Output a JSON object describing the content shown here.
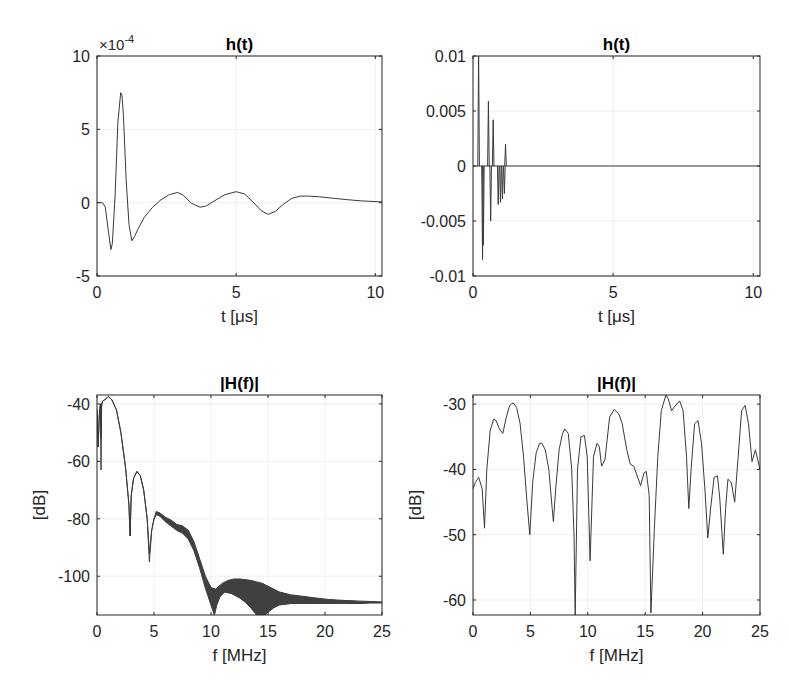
{
  "figure": {
    "width": 789,
    "height": 696,
    "line_color": "#3a3a3a",
    "axis_color": "#262626"
  },
  "chart_data": [
    {
      "id": "top-left",
      "type": "line",
      "title": "h(t)",
      "xlabel": "t [μs]",
      "ylabel": "",
      "exponent_label": "×10",
      "exponent_power": "-4",
      "box": {
        "left": 97,
        "top": 56,
        "right": 382,
        "bottom": 276
      },
      "xlim": [
        0,
        10.24
      ],
      "ylim": [
        -5,
        10
      ],
      "xticks": [
        0,
        5,
        10
      ],
      "xtick_labels": [
        "0",
        "5",
        "10"
      ],
      "yticks": [
        -5,
        0,
        5,
        10
      ],
      "ytick_labels": [
        "-5",
        "0",
        "5",
        "10"
      ],
      "grid": true,
      "y_scale_note": "values in units of 1e-4",
      "series": [
        {
          "name": "h(t)",
          "x": [
            0,
            0.2,
            0.3,
            0.4,
            0.5,
            0.55,
            0.65,
            0.75,
            0.85,
            0.9,
            0.95,
            1.05,
            1.15,
            1.25,
            1.35,
            1.5,
            1.7,
            2.0,
            2.3,
            2.6,
            2.9,
            3.1,
            3.4,
            3.7,
            3.9,
            4.2,
            4.6,
            5.0,
            5.3,
            5.6,
            5.9,
            6.15,
            6.4,
            6.7,
            7.0,
            7.3,
            7.6,
            8.0,
            8.5,
            9.0,
            9.5,
            10.24
          ],
          "y": [
            0,
            0,
            -0.3,
            -1.8,
            -3.2,
            -2.8,
            0.5,
            5.5,
            7.5,
            7.3,
            6.0,
            1.5,
            -1.5,
            -2.6,
            -2.3,
            -1.7,
            -1.0,
            -0.3,
            0.2,
            0.55,
            0.7,
            0.5,
            -0.05,
            -0.3,
            -0.25,
            0.1,
            0.55,
            0.75,
            0.6,
            0.05,
            -0.55,
            -0.8,
            -0.6,
            -0.1,
            0.3,
            0.45,
            0.45,
            0.4,
            0.3,
            0.2,
            0.12,
            0.05
          ]
        }
      ]
    },
    {
      "id": "top-right",
      "type": "line",
      "title": "h(t)",
      "xlabel": "t [μs]",
      "ylabel": "",
      "box": {
        "left": 473,
        "top": 56,
        "right": 760,
        "bottom": 276
      },
      "xlim": [
        0,
        10.24
      ],
      "ylim": [
        -0.01,
        0.01
      ],
      "xticks": [
        0,
        5,
        10
      ],
      "xtick_labels": [
        "0",
        "5",
        "10"
      ],
      "yticks": [
        -0.01,
        -0.005,
        0,
        0.005,
        0.01
      ],
      "ytick_labels": [
        "-0.01",
        "-0.005",
        "0",
        "0.005",
        "0.01"
      ],
      "grid": true,
      "series": [
        {
          "name": "h(t) sparse taps",
          "stems": [
            {
              "t": 0.2,
              "v": 0.0105
            },
            {
              "t": 0.34,
              "v": -0.0085
            },
            {
              "t": 0.37,
              "v": -0.0072
            },
            {
              "t": 0.55,
              "v": 0.0059
            },
            {
              "t": 0.63,
              "v": -0.005
            },
            {
              "t": 0.72,
              "v": 0.0042
            },
            {
              "t": 0.9,
              "v": -0.0035
            },
            {
              "t": 0.98,
              "v": -0.0033
            },
            {
              "t": 1.05,
              "v": -0.003
            },
            {
              "t": 1.12,
              "v": -0.0025
            },
            {
              "t": 1.16,
              "v": 0.002
            }
          ],
          "baseline": 0
        }
      ]
    },
    {
      "id": "bottom-left",
      "type": "line",
      "title": "|H(f)|",
      "xlabel": "f [MHz]",
      "ylabel": "[dB]",
      "box": {
        "left": 97,
        "top": 395,
        "right": 382,
        "bottom": 615
      },
      "xlim": [
        0,
        25
      ],
      "ylim": [
        -113.5,
        -36.9
      ],
      "xticks": [
        0,
        5,
        10,
        15,
        20,
        25
      ],
      "xtick_labels": [
        "0",
        "5",
        "10",
        "15",
        "20",
        "25"
      ],
      "yticks": [
        -100,
        -80,
        -60,
        -40
      ],
      "ytick_labels": [
        "-100",
        "-80",
        "-60",
        "-40"
      ],
      "grid": true,
      "series": [
        {
          "name": "|H(f)| upper envelope",
          "x": [
            0,
            0.1,
            0.2,
            0.3,
            0.35,
            0.4,
            0.5,
            0.7,
            1.0,
            1.3,
            1.7,
            2.1,
            2.5,
            2.8,
            2.9,
            3.0,
            3.2,
            3.5,
            3.8,
            4.1,
            4.4,
            4.6,
            4.8,
            5.0,
            5.2,
            5.5,
            6.0,
            6.5,
            7.0,
            7.5,
            8.0,
            8.5,
            9.0,
            9.5,
            10.0,
            10.4,
            10.7,
            11.0,
            11.5,
            12.0,
            12.5,
            13.0,
            13.5,
            14.0,
            14.5,
            15.0,
            15.5,
            16.0,
            17.0,
            18.0,
            19.0,
            20.0,
            21.0,
            22.0,
            23.0,
            24.0,
            25.0
          ],
          "y": [
            -42,
            -55,
            -44,
            -40,
            -52,
            -40,
            -39,
            -38.5,
            -37.5,
            -38.5,
            -42,
            -50,
            -62,
            -75,
            -86,
            -72,
            -66,
            -63.5,
            -65,
            -70,
            -80,
            -92,
            -84,
            -80,
            -77.5,
            -78,
            -79.5,
            -80.5,
            -82,
            -82.5,
            -84,
            -88,
            -94,
            -100,
            -104,
            -104.5,
            -103.5,
            -102.5,
            -101.5,
            -101,
            -101,
            -101.2,
            -101.5,
            -102,
            -102.5,
            -103.5,
            -104.5,
            -105.5,
            -106.5,
            -107,
            -107.5,
            -108,
            -108.3,
            -108.5,
            -108.7,
            -108.8,
            -109
          ]
        },
        {
          "name": "|H(f)| lower envelope",
          "x": [
            0,
            0.1,
            0.2,
            0.3,
            0.35,
            0.4,
            0.5,
            0.7,
            1.0,
            1.3,
            1.7,
            2.1,
            2.5,
            2.8,
            2.9,
            3.0,
            3.2,
            3.5,
            3.8,
            4.1,
            4.4,
            4.6,
            4.8,
            5.0,
            5.2,
            5.5,
            6.0,
            6.5,
            7.0,
            7.5,
            8.0,
            8.5,
            9.0,
            9.5,
            10.0,
            10.3,
            10.5,
            10.8,
            11.2,
            11.8,
            12.5,
            13.0,
            13.5,
            14.0,
            14.3,
            14.7,
            15.0,
            15.5,
            16.0,
            17.0,
            18.0,
            19.0,
            20.0,
            21.0,
            22.0,
            23.0,
            24.0,
            25.0
          ],
          "y": [
            -42,
            -55,
            -44,
            -40,
            -63,
            -41,
            -39,
            -38.5,
            -37.5,
            -38.5,
            -42,
            -50,
            -62,
            -75,
            -86,
            -72,
            -66,
            -63.5,
            -65,
            -70,
            -80,
            -95,
            -84,
            -80,
            -78.5,
            -79,
            -81,
            -82.5,
            -84,
            -85,
            -87,
            -91,
            -97,
            -104,
            -110,
            -113.5,
            -110,
            -107,
            -105.5,
            -106,
            -107.5,
            -109,
            -111,
            -113.5,
            -113.5,
            -113.5,
            -112.5,
            -111,
            -110,
            -109.5,
            -109.5,
            -109.5,
            -109.5,
            -109.5,
            -109.5,
            -109.5,
            -109.3,
            -109.3
          ]
        }
      ]
    },
    {
      "id": "bottom-right",
      "type": "line",
      "title": "|H(f)|",
      "xlabel": "f [MHz]",
      "ylabel": "[dB]",
      "box": {
        "left": 473,
        "top": 395,
        "right": 760,
        "bottom": 615
      },
      "xlim": [
        0,
        25
      ],
      "ylim": [
        -62.3,
        -28.6
      ],
      "xticks": [
        0,
        5,
        10,
        15,
        20,
        25
      ],
      "xtick_labels": [
        "0",
        "5",
        "10",
        "15",
        "20",
        "25"
      ],
      "yticks": [
        -60,
        -50,
        -40,
        -30
      ],
      "ytick_labels": [
        "-60",
        "-50",
        "-40",
        "-30"
      ],
      "grid": true,
      "series": [
        {
          "name": "|H(f)|",
          "x": [
            0,
            0.2,
            0.5,
            0.8,
            1.0,
            1.2,
            1.5,
            1.8,
            2.0,
            2.3,
            2.6,
            2.9,
            3.2,
            3.5,
            3.8,
            4.1,
            4.4,
            4.7,
            4.95,
            5.2,
            5.5,
            5.8,
            6.0,
            6.3,
            6.6,
            6.9,
            7.0,
            7.2,
            7.5,
            7.8,
            8.0,
            8.3,
            8.6,
            8.8,
            8.9,
            9.1,
            9.4,
            9.7,
            9.95,
            10.2,
            10.5,
            10.8,
            11.0,
            11.2,
            11.5,
            11.9,
            12.3,
            12.7,
            13.0,
            13.4,
            13.7,
            14.0,
            14.3,
            14.6,
            14.9,
            15.1,
            15.35,
            15.5,
            15.8,
            16.1,
            16.4,
            16.8,
            17.0,
            17.3,
            17.6,
            18.0,
            18.3,
            18.6,
            18.8,
            19.0,
            19.3,
            19.6,
            19.9,
            20.2,
            20.45,
            20.7,
            21.0,
            21.3,
            21.5,
            21.8,
            22.0,
            22.2,
            22.5,
            22.8,
            23.1,
            23.4,
            23.7,
            24.0,
            24.3,
            24.6,
            24.8,
            25.0
          ],
          "y": [
            -43,
            -42,
            -41.2,
            -43,
            -49,
            -40,
            -34,
            -32.3,
            -32.5,
            -33.8,
            -34.5,
            -32,
            -30.2,
            -29.8,
            -30.5,
            -33,
            -38,
            -45,
            -50,
            -42,
            -37.5,
            -36,
            -36,
            -37,
            -40,
            -46,
            -48,
            -43,
            -37,
            -34.5,
            -33.8,
            -34.5,
            -40,
            -50,
            -62.3,
            -40,
            -35,
            -34.8,
            -38,
            -54,
            -38,
            -36,
            -36.5,
            -39.5,
            -38.5,
            -32,
            -30.8,
            -31.5,
            -33,
            -37,
            -39.2,
            -39.5,
            -41,
            -42.5,
            -40.5,
            -40.3,
            -44,
            -62,
            -49,
            -38,
            -31,
            -28.6,
            -29.2,
            -31,
            -30.3,
            -29.5,
            -31,
            -38,
            -46,
            -40,
            -33,
            -32.5,
            -36,
            -43,
            -50.5,
            -46,
            -41.2,
            -41,
            -44.5,
            -53,
            -46,
            -41.5,
            -42,
            -45,
            -38,
            -31,
            -30.2,
            -33,
            -38.8,
            -37,
            -38.5,
            -40
          ]
        }
      ]
    }
  ]
}
